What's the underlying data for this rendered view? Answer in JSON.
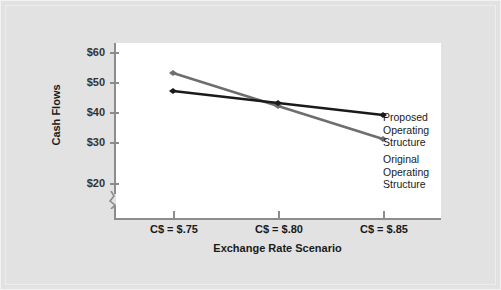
{
  "chart_data": {
    "type": "line",
    "title": "",
    "xlabel": "Exchange Rate Scenario",
    "ylabel": "Cash Flows",
    "categories": [
      "C$ = $.75",
      "C$ = $.80",
      "C$ = $.85"
    ],
    "x_tick_labels": [
      "C$ = $.75",
      "C$ = $.80",
      "C$ = $.85"
    ],
    "y_tick_labels": [
      "$60",
      "$50",
      "$40",
      "$30",
      "$20"
    ],
    "y_tick_values": [
      60,
      50,
      40,
      30,
      20
    ],
    "ylim": [
      20,
      60
    ],
    "y_axis_break": true,
    "grid": false,
    "legend_position": "right",
    "series": [
      {
        "name": "Original Operating Structure",
        "color": "#6e6e6e",
        "values": [
          53,
          42,
          31
        ],
        "marker": "arrow"
      },
      {
        "name": "Proposed Operating Structure",
        "color": "#1a1a1a",
        "values": [
          47,
          43,
          39
        ],
        "marker": "arrow"
      }
    ],
    "annotations": [
      {
        "id": "proposed",
        "lines": [
          "Proposed",
          "Operating",
          "Structure"
        ]
      },
      {
        "id": "original",
        "lines": [
          "Original",
          "Operating",
          "Structure"
        ]
      }
    ]
  },
  "axes": {
    "y_title": "Cash Flows",
    "x_title": "Exchange Rate Scenario",
    "y_ticks": [
      {
        "label": "$60"
      },
      {
        "label": "$50"
      },
      {
        "label": "$40"
      },
      {
        "label": "$30"
      },
      {
        "label": "$20"
      }
    ],
    "x_ticks": [
      {
        "label": "C$ = $.75"
      },
      {
        "label": "C$ = $.80"
      },
      {
        "label": "C$ = $.85"
      }
    ]
  },
  "legend": {
    "proposed": {
      "line1": "Proposed",
      "line2": "Operating",
      "line3": "Structure"
    },
    "original": {
      "line1": "Original",
      "line2": "Operating",
      "line3": "Structure"
    }
  },
  "colors": {
    "background": "#e2e2e2",
    "plot_background": "#ffffff",
    "axis": "#8c8c8c",
    "series_original": "#6e6e6e",
    "series_proposed": "#1a1a1a",
    "text": "#1a1a1a"
  }
}
